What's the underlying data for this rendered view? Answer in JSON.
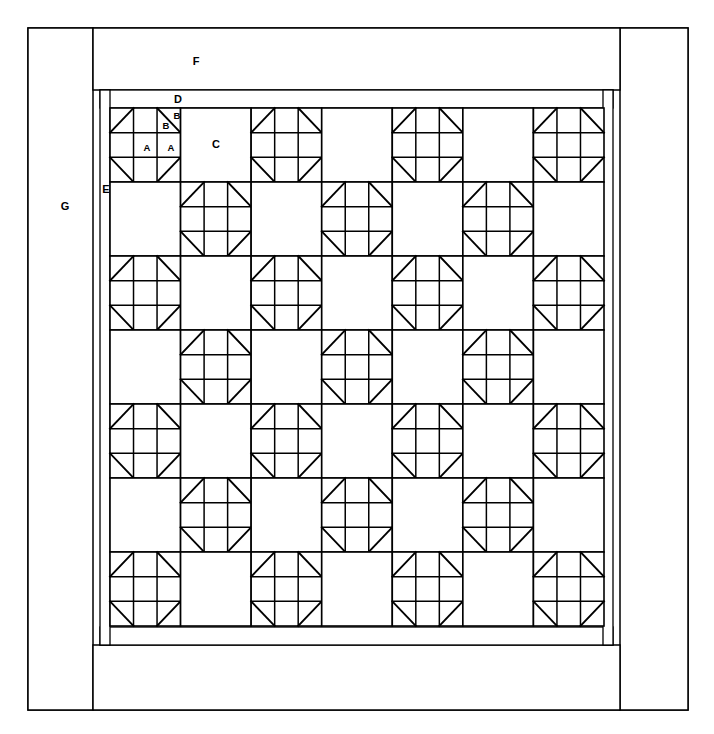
{
  "diagram": {
    "type": "quilt-piecing-layout",
    "background_color": "#ffffff",
    "line_color": "#000000"
  },
  "labels": {
    "A": "A",
    "B1": "B",
    "B2": "B",
    "C": "C",
    "D": "D",
    "E": "E",
    "F": "F",
    "G": "G"
  },
  "legend": {
    "A": "small plain square unit",
    "B": "half-square triangle piece",
    "C": "large plain alternate block",
    "D": "narrow horizontal inner border strip",
    "E": "narrow vertical inner border strip",
    "F": "wide horizontal outer border",
    "G": "wide vertical outer border"
  },
  "layout": {
    "outer_frame": {
      "x": 28,
      "y": 28,
      "width": 660,
      "height": 682
    },
    "side_border_left": {
      "x": 28,
      "y": 28,
      "width": 65,
      "height": 682
    },
    "side_border_right": {
      "x": 620,
      "y": 28,
      "width": 68,
      "height": 682
    },
    "top_border": {
      "x": 93,
      "y": 28,
      "width": 527,
      "height": 62
    },
    "bottom_border": {
      "x": 93,
      "y": 645,
      "width": 527,
      "height": 65
    },
    "inner_border_top": {
      "x": 100,
      "y": 90,
      "width": 513,
      "height": 18
    },
    "inner_border_bottom": {
      "x": 100,
      "y": 627,
      "width": 513,
      "height": 18
    },
    "inner_border_left": {
      "x": 100,
      "y": 90,
      "width": 10,
      "height": 555
    },
    "inner_border_right": {
      "x": 603,
      "y": 90,
      "width": 10,
      "height": 555
    },
    "field": {
      "x": 110,
      "y": 108,
      "width": 494,
      "height": 518
    },
    "grid": {
      "columns": 7,
      "rows": 7,
      "cell_width": 70.6,
      "cell_height": 74.0
    }
  },
  "chart_data": {
    "type": "grid-diagram",
    "grid_rows": 7,
    "grid_cols": 7,
    "pattern": "checkerboard alternating pieced star block and plain square",
    "block_names": [
      "star-block",
      "plain-block"
    ],
    "blocks": [
      [
        "star",
        "plain",
        "star",
        "plain",
        "star",
        "plain",
        "star"
      ],
      [
        "plain",
        "star",
        "plain",
        "star",
        "plain",
        "star",
        "plain"
      ],
      [
        "star",
        "plain",
        "star",
        "plain",
        "star",
        "plain",
        "star"
      ],
      [
        "plain",
        "star",
        "plain",
        "star",
        "plain",
        "star",
        "plain"
      ],
      [
        "star",
        "plain",
        "star",
        "plain",
        "star",
        "plain",
        "star"
      ],
      [
        "plain",
        "star",
        "plain",
        "star",
        "plain",
        "star",
        "plain"
      ],
      [
        "star",
        "plain",
        "star",
        "plain",
        "star",
        "plain",
        "star"
      ]
    ],
    "star_block_structure": {
      "subgrid": 3,
      "corner_units": "half-square triangle (pieces B + B)",
      "edge_units": "plain square (piece A)",
      "center_unit": "plain square (piece A)",
      "corner_diagonal_orientation": {
        "top_left": "from bottom-left to top-right",
        "top_right": "from top-left to bottom-right",
        "bottom_left": "from top-left to bottom-right",
        "bottom_right": "from bottom-left to top-right"
      }
    },
    "pieces": [
      {
        "code": "A",
        "description": "small plain square unit"
      },
      {
        "code": "B",
        "description": "half-square triangle piece"
      },
      {
        "code": "C",
        "description": "large plain alternate block"
      },
      {
        "code": "D",
        "description": "narrow horizontal inner border strip"
      },
      {
        "code": "E",
        "description": "narrow vertical inner border strip"
      },
      {
        "code": "F",
        "description": "wide horizontal outer border"
      },
      {
        "code": "G",
        "description": "wide vertical outer border"
      }
    ]
  }
}
